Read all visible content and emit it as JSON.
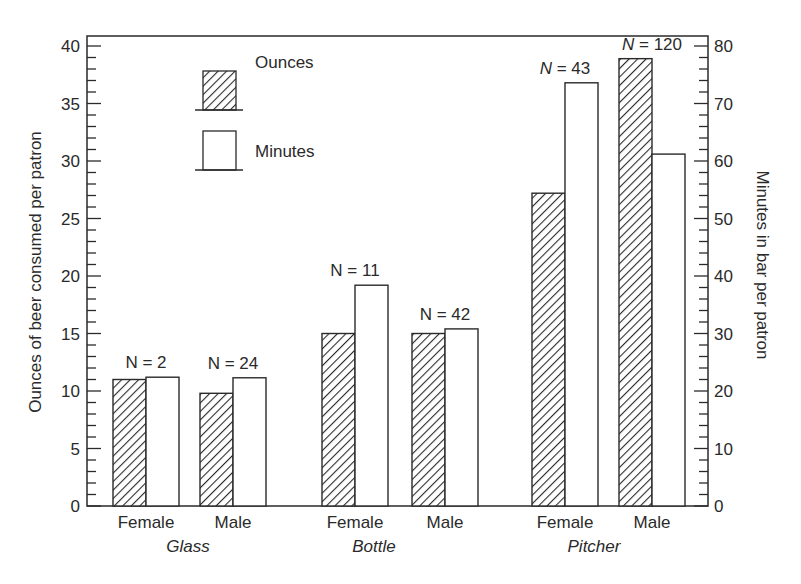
{
  "chart_data": {
    "type": "bar",
    "title": "",
    "groups": [
      "Glass",
      "Bottle",
      "Pitcher"
    ],
    "categories": [
      "Glass Female",
      "Glass Male",
      "Bottle Female",
      "Bottle Male",
      "Pitcher Female",
      "Pitcher Male"
    ],
    "x_labels": [
      "Female",
      "Male",
      "Female",
      "Male",
      "Female",
      "Male"
    ],
    "n_labels": [
      "N = 2",
      "N = 24",
      "N = 11",
      "N = 42",
      "N = 43",
      "N = 120"
    ],
    "series": [
      {
        "name": "Ounces",
        "axis": "left",
        "pattern": "hatched",
        "values": [
          11.0,
          9.8,
          15.0,
          15.0,
          27.2,
          38.9
        ]
      },
      {
        "name": "Minutes",
        "axis": "right",
        "pattern": "white",
        "values": [
          22.4,
          22.3,
          38.4,
          30.8,
          73.6,
          61.2
        ]
      }
    ],
    "ylabel": "Ounces of beer consumed per patron",
    "ylabel_right": "Minutes in bar per patron",
    "xlabel": "",
    "ylim": [
      0,
      40
    ],
    "ylim_right": [
      0,
      80
    ],
    "yticks": [
      0,
      5,
      10,
      15,
      20,
      25,
      30,
      35,
      40
    ],
    "yticks_right": [
      0,
      10,
      20,
      30,
      40,
      50,
      60,
      70,
      80
    ],
    "legend": {
      "position": "upper-left",
      "entries": [
        "Ounces",
        "Minutes"
      ]
    },
    "grid": false
  }
}
